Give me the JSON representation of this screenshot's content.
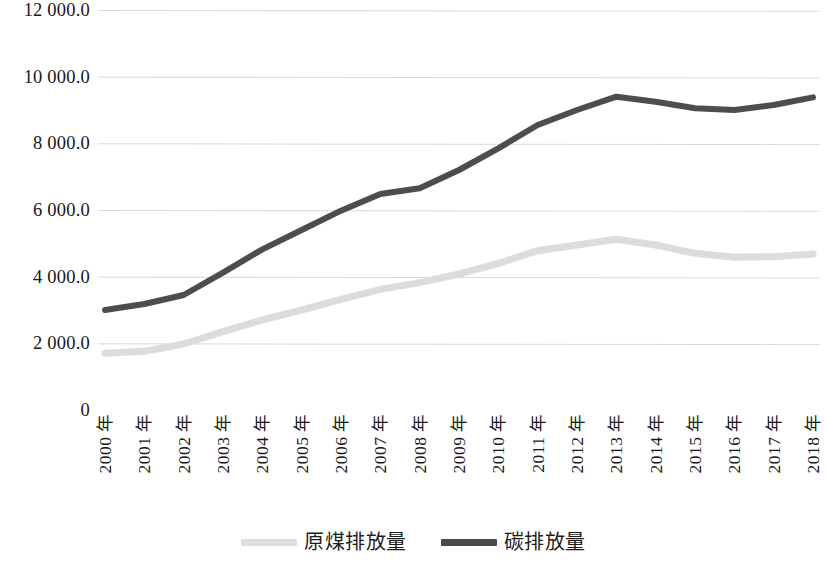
{
  "chart_data": {
    "type": "line",
    "title": "",
    "xlabel": "",
    "ylabel": "",
    "ylim": [
      0,
      12000
    ],
    "grid": true,
    "legend_position": "bottom-center",
    "categories": [
      "2000 年",
      "2001 年",
      "2002 年",
      "2003 年",
      "2004 年",
      "2005 年",
      "2006 年",
      "2007 年",
      "2008 年",
      "2009 年",
      "2010 年",
      "2011 年",
      "2012 年",
      "2013 年",
      "2014 年",
      "2015 年",
      "2016 年",
      "2017 年",
      "2018 年"
    ],
    "ytick_labels": [
      "12 000.0",
      "10 000.0",
      "8 000.0",
      "6 000.0",
      "4 000.0",
      "2 000.0",
      "0"
    ],
    "ytick_values": [
      12000,
      10000,
      8000,
      6000,
      4000,
      2000,
      0
    ],
    "series": [
      {
        "name": "原煤排放量",
        "color": "#dcdcdc",
        "values": [
          1700,
          1760,
          1980,
          2350,
          2700,
          3000,
          3320,
          3620,
          3820,
          4080,
          4400,
          4780,
          4950,
          5120,
          4950,
          4700,
          4580,
          4600,
          4680
        ]
      },
      {
        "name": "碳排放量",
        "color": "#4d4d4d",
        "values": [
          3000,
          3180,
          3450,
          4120,
          4820,
          5400,
          5980,
          6480,
          6650,
          7200,
          7850,
          8550,
          9000,
          9400,
          9250,
          9050,
          9000,
          9150,
          9380
        ]
      }
    ]
  },
  "legend": {
    "items": [
      {
        "label": "原煤排放量",
        "swatch_class": "coal"
      },
      {
        "label": "碳排放量",
        "swatch_class": "carbon"
      }
    ]
  }
}
